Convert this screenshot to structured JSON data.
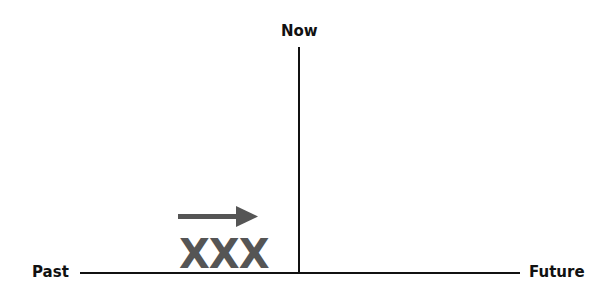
{
  "diagram": {
    "labels": {
      "now": "Now",
      "past": "Past",
      "future": "Future",
      "marker": "XXX"
    },
    "colors": {
      "line": "#111111",
      "arrow": "#555555",
      "marker": "#555555"
    },
    "arrow_direction": "right"
  }
}
